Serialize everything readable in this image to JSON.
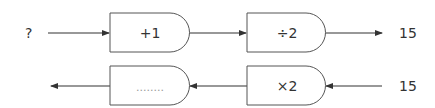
{
  "diagram": {
    "type": "function-machine",
    "top_row": {
      "input": "?",
      "steps": [
        "+1",
        "÷2"
      ],
      "output": "15"
    },
    "bottom_row": {
      "input": "15",
      "steps": [
        "×2",
        "........"
      ],
      "output": ""
    },
    "colors": {
      "stroke": "#333333",
      "text": "#333333",
      "dots": "#999999"
    }
  }
}
